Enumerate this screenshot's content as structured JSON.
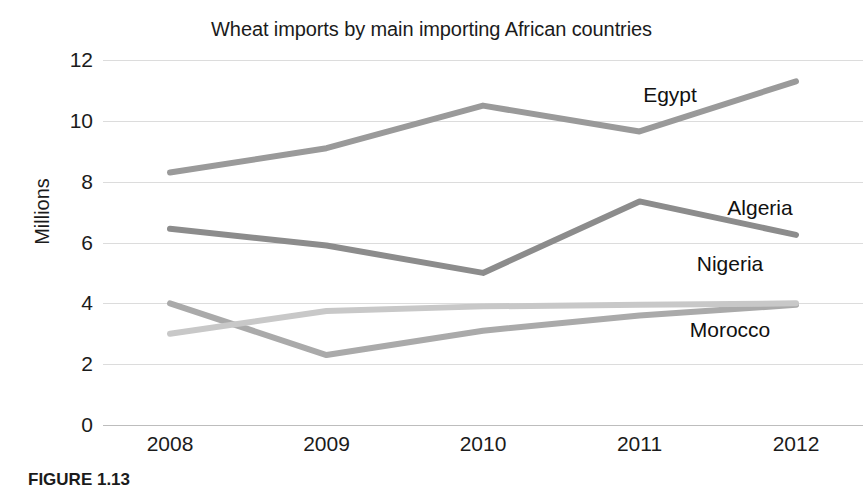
{
  "chart_data": {
    "type": "line",
    "title": "Wheat imports by main importing African countries",
    "xlabel": "",
    "ylabel": "Millions",
    "x": [
      2008,
      2009,
      2010,
      2011,
      2012
    ],
    "xtick_labels": [
      "2008",
      "2009",
      "2010",
      "2011",
      "2012"
    ],
    "ytick_labels": [
      "12",
      "10",
      "8",
      "6",
      "4",
      "2",
      "0"
    ],
    "yticks": [
      12,
      10,
      8,
      6,
      4,
      2,
      0
    ],
    "ylim": [
      0,
      12
    ],
    "grid": true,
    "legend": "inline-labels-right",
    "series": [
      {
        "name": "Egypt",
        "color": "#9a9a9a",
        "values": [
          8.3,
          9.1,
          10.5,
          9.65,
          11.3
        ]
      },
      {
        "name": "Algeria",
        "color": "#8c8c8c",
        "values": [
          6.45,
          5.9,
          5.0,
          7.35,
          6.25
        ]
      },
      {
        "name": "Nigeria",
        "color": "#aaaaaa",
        "values": [
          4.0,
          2.3,
          3.1,
          3.6,
          3.95
        ]
      },
      {
        "name": "Morocco",
        "color": "#c8c8c8",
        "values": [
          3.0,
          3.75,
          3.9,
          3.95,
          4.0
        ]
      }
    ],
    "annotations": [
      {
        "text": "Egypt",
        "x_px": 670,
        "y_px": 95
      },
      {
        "text": "Algeria",
        "x_px": 760,
        "y_px": 208
      },
      {
        "text": "Nigeria",
        "x_px": 730,
        "y_px": 264
      },
      {
        "text": "Morocco",
        "x_px": 730,
        "y_px": 330
      }
    ]
  },
  "caption": {
    "text": "FIGURE 1.13"
  },
  "colors": {
    "background": "#ffffff",
    "text": "#1b1b1b",
    "gridline": "#dcdcdc"
  }
}
